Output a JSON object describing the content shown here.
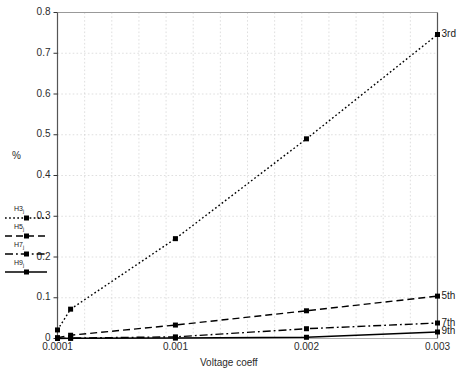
{
  "chart_data": {
    "type": "line",
    "title": "",
    "xlabel": "Voltage coeff",
    "ylabel": "%",
    "xtick_labels": [
      "0.0001",
      "0.001",
      "0.002",
      "0.003"
    ],
    "xtick_values": [
      0.0001,
      0.001,
      0.002,
      0.003
    ],
    "ytick_labels": [
      "0",
      "0.1",
      "0.2",
      "0.3",
      "0.4",
      "0.5",
      "0.6",
      "0.7",
      "0.8"
    ],
    "ytick_values": [
      0,
      0.1,
      0.2,
      0.3,
      0.4,
      0.5,
      0.6,
      0.7,
      0.8
    ],
    "xlim": [
      0.0001,
      0.003
    ],
    "ylim": [
      0,
      0.8
    ],
    "grid": true,
    "legend_position": "left-outside",
    "series": [
      {
        "name": "H3",
        "legend_label": "H3",
        "end_label": "3rd",
        "marker": "square",
        "line_style": "dotted",
        "color": "#000000",
        "x": [
          0.0001,
          0.0002,
          0.001,
          0.002,
          0.003
        ],
        "y": [
          0.021,
          0.072,
          0.245,
          0.49,
          0.746
        ]
      },
      {
        "name": "H5",
        "legend_label": "H5",
        "end_label": "5th",
        "marker": "square",
        "line_style": "dashed",
        "color": "#000000",
        "x": [
          0.0001,
          0.0002,
          0.001,
          0.002,
          0.003
        ],
        "y": [
          0.002,
          0.008,
          0.033,
          0.068,
          0.104
        ]
      },
      {
        "name": "H7",
        "legend_label": "H7",
        "end_label": "7th",
        "marker": "square",
        "line_style": "dash-dot",
        "color": "#000000",
        "x": [
          0.0001,
          0.0002,
          0.001,
          0.002,
          0.003
        ],
        "y": [
          0.0005,
          0.001,
          0.004,
          0.024,
          0.038
        ]
      },
      {
        "name": "H9",
        "legend_label": "H9",
        "end_label": "9th",
        "marker": "square",
        "line_style": "solid",
        "color": "#000000",
        "x": [
          0.0001,
          0.0002,
          0.001,
          0.002,
          0.003
        ],
        "y": [
          0.0002,
          0.0005,
          0.001,
          0.003,
          0.016
        ]
      }
    ]
  },
  "legend": {
    "entries": [
      {
        "label": "H3",
        "sub": "j"
      },
      {
        "label": "H5",
        "sub": "j"
      },
      {
        "label": "H7",
        "sub": "j"
      },
      {
        "label": "H9",
        "sub": "j"
      }
    ]
  },
  "axes": {
    "y_title": "%",
    "x_title": "Voltage coeff"
  }
}
